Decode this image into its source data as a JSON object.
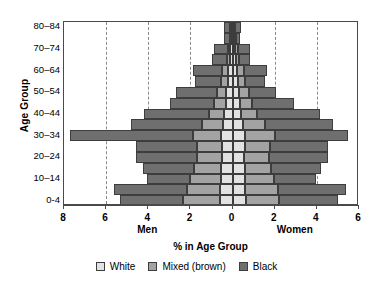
{
  "chart_data": {
    "type": "bar",
    "subtype": "population-pyramid",
    "title": "",
    "xlabel": "% in Age Group",
    "ylabel": "Age Group",
    "left_side_label": "Men",
    "right_side_label": "Women",
    "xlim": [
      -8,
      6
    ],
    "xticks": [
      8,
      6,
      4,
      2,
      0,
      2,
      4,
      6
    ],
    "xtick_values": [
      -8,
      -6,
      -4,
      -2,
      0,
      2,
      4,
      6
    ],
    "grid": true,
    "gridlines_at": [
      -6,
      -4,
      -2,
      0,
      2,
      4
    ],
    "legend_position": "bottom",
    "categories": [
      "0-4",
      "5-9",
      "10-14",
      "15-19",
      "20-24",
      "25-29",
      "30-34",
      "35-39",
      "40-44",
      "45-49",
      "50-54",
      "55-59",
      "60-64",
      "65-69",
      "70-74",
      "75-79",
      "80-84"
    ],
    "ytick_labels": [
      "0-4",
      "10–14",
      "20–24",
      "30–34",
      "40–44",
      "50–54",
      "60–64",
      "70–74",
      "80–84"
    ],
    "series": [
      {
        "name": "White",
        "color": "#e2e2e2",
        "men": [
          0.6,
          0.58,
          0.55,
          0.55,
          0.5,
          0.52,
          0.55,
          0.45,
          0.4,
          0.32,
          0.3,
          0.22,
          0.2,
          0.12,
          0.1,
          0.06,
          0.05
        ],
        "women": [
          0.62,
          0.6,
          0.58,
          0.58,
          0.55,
          0.58,
          0.6,
          0.5,
          0.42,
          0.35,
          0.32,
          0.24,
          0.22,
          0.14,
          0.12,
          0.07,
          0.06
        ]
      },
      {
        "name": "Mixed (brown)",
        "color": "#a3a3a3",
        "men": [
          1.75,
          1.6,
          1.45,
          1.3,
          1.2,
          1.15,
          1.35,
          1.0,
          0.7,
          0.55,
          0.45,
          0.32,
          0.28,
          0.16,
          0.14,
          0.08,
          0.06
        ],
        "women": [
          1.6,
          1.55,
          1.4,
          1.25,
          1.18,
          1.2,
          1.4,
          1.05,
          0.75,
          0.58,
          0.48,
          0.35,
          0.3,
          0.18,
          0.15,
          0.09,
          0.07
        ]
      },
      {
        "name": "Black",
        "color": "#6f6f6f",
        "men": [
          2.98,
          3.45,
          2.05,
          2.4,
          2.9,
          2.9,
          5.8,
          3.35,
          3.1,
          2.1,
          1.95,
          1.25,
          1.4,
          0.72,
          0.65,
          0.25,
          0.32
        ],
        "women": [
          2.8,
          3.25,
          2.0,
          2.35,
          2.8,
          2.75,
          3.5,
          3.2,
          3.0,
          2.0,
          1.25,
          0.95,
          1.1,
          0.5,
          0.55,
          0.2,
          0.28
        ]
      }
    ],
    "legend_entries": [
      {
        "label": "White",
        "color": "#e2e2e2"
      },
      {
        "label": "Mixed (brown)",
        "color": "#a3a3a3"
      },
      {
        "label": "Black",
        "color": "#6f6f6f"
      }
    ]
  }
}
